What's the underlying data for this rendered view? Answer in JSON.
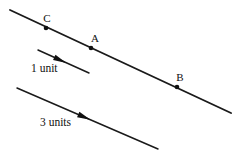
{
  "figure": {
    "background_color": "#ffffff",
    "ink_color": "#111111",
    "width": 243,
    "height": 161,
    "main_line": {
      "name": "main-line",
      "x1": 10,
      "y1": 10,
      "x2": 231,
      "y2": 113
    },
    "points": [
      {
        "id": "C",
        "label": "C",
        "cx": 46,
        "cy": 28,
        "label_x": 47,
        "label_y": 22,
        "radius": 2.3
      },
      {
        "id": "A",
        "label": "A",
        "cx": 91,
        "cy": 48,
        "label_x": 95,
        "label_y": 42,
        "radius": 2.3
      },
      {
        "id": "B",
        "label": "B",
        "cx": 177,
        "cy": 87,
        "label_x": 180,
        "label_y": 81,
        "radius": 2.3
      }
    ],
    "measures": [
      {
        "id": "one-unit",
        "label": "1 unit",
        "line": {
          "x1": 38,
          "y1": 50,
          "x2": 89,
          "y2": 73
        },
        "arrow": {
          "x": 60,
          "y": 60,
          "angle": 24.3,
          "size": 7
        },
        "label_x": 31,
        "label_y": 72
      },
      {
        "id": "three-units",
        "label": "3 units",
        "line": {
          "x1": 17,
          "y1": 88,
          "x2": 158,
          "y2": 149
        },
        "arrow": {
          "x": 84,
          "y": 117,
          "angle": 23.4,
          "size": 7
        },
        "label_x": 40,
        "label_y": 126
      }
    ]
  }
}
